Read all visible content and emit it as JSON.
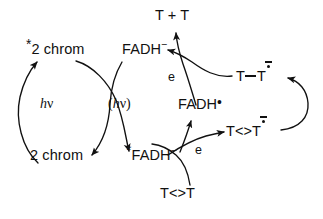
{
  "figure": {
    "name": "photolyase-dna-repair-scheme",
    "background_color": "#ffffff",
    "stroke_color": "#111111",
    "width": 323,
    "height": 219
  },
  "labels": {
    "chrom_excited": {
      "star": "*",
      "text": "2 chrom"
    },
    "chrom_ground": {
      "text": "2 chrom"
    },
    "hv_left": {
      "h": "h",
      "nu": "ν"
    },
    "hv_transfer": {
      "open": "(",
      "h": "h",
      "nu": "ν",
      "close": ")"
    },
    "fadh_anion_top": {
      "text": "FADH",
      "charge": "−"
    },
    "fadh_anion_excited": {
      "star": "*",
      "text": "FADH",
      "charge": "−"
    },
    "fadh_radical": {
      "text": "FADH",
      "dot": "•"
    },
    "electron_top": {
      "text": "e"
    },
    "electron_bottom": {
      "text": "e"
    },
    "thymine_pair": {
      "text": "T + T"
    },
    "thymine_dimer_substrate": {
      "text": "T<>T"
    },
    "thymine_dimer_radical_anion": {
      "text_left": "T<>T",
      "radical_anion": "•−"
    },
    "thymine_bonded_radical_anion": {
      "text_left": "T",
      "bond": "—",
      "text_right": "T",
      "radical_anion": "•−"
    }
  },
  "arrows": [
    {
      "name": "arrow-chrom-ground-to-excited",
      "description": "left cycle, bottom-left 2 chrom up to *2 chrom, labelled h nu"
    },
    {
      "name": "arrow-excited-chrom-to-fadh-anion-excited",
      "description": "energy transfer from *2 chrom down-right to *FADH-"
    },
    {
      "name": "arrow-fadh-anion-to-chrom-ground",
      "description": "crossing curve from FADH- down-left to 2 chrom"
    },
    {
      "name": "arrow-electron-donation-to-dimer",
      "description": "*FADH- donates electron e to T<>T forming T<>T radical anion"
    },
    {
      "name": "arrow-dimer-substrate-up",
      "description": "T<>T substrate enters from bottom"
    },
    {
      "name": "arrow-dimer-radical-anion-to-bonded-radical",
      "description": "right loop from T<>T radical anion to T_T radical anion"
    },
    {
      "name": "arrow-bonded-radical-to-fadh-anion",
      "description": "back electron transfer e from T_T radical anion to FADH-"
    },
    {
      "name": "arrow-release-thymines",
      "description": "release of repaired T + T upward"
    },
    {
      "name": "arrow-radical-to-fadh-radical",
      "description": "FADH radical regeneration arrow"
    }
  ]
}
